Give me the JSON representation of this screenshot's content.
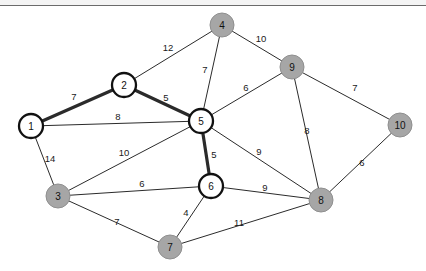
{
  "canvas": {
    "width": 426,
    "height": 271,
    "background": "#ffffff",
    "top_rule_y": 5,
    "top_rule_color": "#6b6b6b"
  },
  "legend": {
    "visited_node_color": "#a6a6a6",
    "frontier_node_color": "#ffffff",
    "edge_color": "#2b2b2b",
    "highlight_edge_color": "#2b2b2b"
  },
  "graph": {
    "title": "",
    "type": "weighted-undirected-graph",
    "node_radius_visited": 12,
    "node_radius_frontier": 12,
    "nodes": [
      {
        "id": "1",
        "label": "1",
        "x": 31,
        "y": 126,
        "style": "frontier"
      },
      {
        "id": "2",
        "label": "2",
        "x": 124,
        "y": 85,
        "style": "frontier"
      },
      {
        "id": "3",
        "label": "3",
        "x": 58,
        "y": 196,
        "style": "visited"
      },
      {
        "id": "4",
        "label": "4",
        "x": 222,
        "y": 25,
        "style": "visited"
      },
      {
        "id": "5",
        "label": "5",
        "x": 201,
        "y": 121,
        "style": "frontier"
      },
      {
        "id": "6",
        "label": "6",
        "x": 211,
        "y": 186,
        "style": "frontier"
      },
      {
        "id": "7",
        "label": "7",
        "x": 170,
        "y": 247,
        "style": "visited"
      },
      {
        "id": "8",
        "label": "8",
        "x": 321,
        "y": 200,
        "style": "visited"
      },
      {
        "id": "9",
        "label": "9",
        "x": 292,
        "y": 67,
        "style": "visited"
      },
      {
        "id": "10",
        "label": "10",
        "x": 400,
        "y": 125,
        "style": "visited"
      }
    ],
    "edges": [
      {
        "from": "1",
        "to": "2",
        "weight": "7",
        "highlight": true,
        "lx": 74,
        "ly": 97
      },
      {
        "from": "1",
        "to": "5",
        "weight": "8",
        "highlight": false,
        "lx": 118,
        "ly": 117
      },
      {
        "from": "1",
        "to": "3",
        "weight": "14",
        "highlight": false,
        "lx": 50,
        "ly": 159
      },
      {
        "from": "2",
        "to": "5",
        "weight": "5",
        "highlight": true,
        "lx": 166,
        "ly": 98
      },
      {
        "from": "2",
        "to": "4",
        "weight": "12",
        "highlight": false,
        "lx": 168,
        "ly": 48
      },
      {
        "from": "4",
        "to": "5",
        "weight": "7",
        "highlight": false,
        "lx": 205,
        "ly": 70
      },
      {
        "from": "4",
        "to": "9",
        "weight": "10",
        "highlight": false,
        "lx": 261,
        "ly": 39
      },
      {
        "from": "5",
        "to": "9",
        "weight": "6",
        "highlight": false,
        "lx": 246,
        "ly": 88
      },
      {
        "from": "5",
        "to": "6",
        "weight": "5",
        "highlight": true,
        "lx": 214,
        "ly": 155
      },
      {
        "from": "5",
        "to": "8",
        "weight": "9",
        "highlight": false,
        "lx": 259,
        "ly": 152
      },
      {
        "from": "3",
        "to": "5",
        "weight": "10",
        "highlight": false,
        "lx": 124,
        "ly": 153
      },
      {
        "from": "3",
        "to": "6",
        "weight": "6",
        "highlight": false,
        "lx": 142,
        "ly": 184
      },
      {
        "from": "3",
        "to": "7",
        "weight": "7",
        "highlight": false,
        "lx": 117,
        "ly": 222
      },
      {
        "from": "6",
        "to": "7",
        "weight": "4",
        "highlight": false,
        "lx": 186,
        "ly": 213
      },
      {
        "from": "6",
        "to": "8",
        "weight": "9",
        "highlight": false,
        "lx": 265,
        "ly": 188
      },
      {
        "from": "7",
        "to": "8",
        "weight": "11",
        "highlight": false,
        "lx": 239,
        "ly": 223
      },
      {
        "from": "9",
        "to": "8",
        "weight": "8",
        "highlight": false,
        "lx": 307,
        "ly": 131
      },
      {
        "from": "9",
        "to": "10",
        "weight": "7",
        "highlight": false,
        "lx": 355,
        "ly": 88
      },
      {
        "from": "8",
        "to": "10",
        "weight": "6",
        "highlight": false,
        "lx": 362,
        "ly": 163
      }
    ]
  }
}
